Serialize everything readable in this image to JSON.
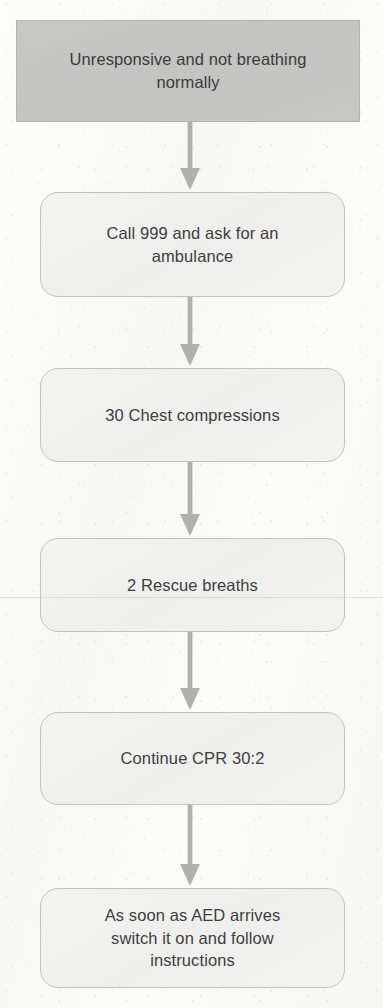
{
  "document": {
    "title": "Unresponsive and not breathing normally",
    "type": "flowchart",
    "subject": "Adult CPR / basic life support sequence"
  },
  "theme": {
    "page_background": "#fbfbfa",
    "header_fill": "#c6c6c4",
    "header_border": "#b4b4b2",
    "step_fill": "#f1f1ef",
    "step_border": "#c2c2c0",
    "arrow_color": "#b0b0ae",
    "text_color": "#3e3e3e"
  },
  "flowchart": {
    "type": "vertical-sequence",
    "nodes": [
      {
        "id": "node-1",
        "label": "Unresponsive and not breathing\nnormally",
        "shape": "rectangle",
        "style": "header"
      },
      {
        "id": "node-2",
        "label": "Call 999 and ask for an\nambulance",
        "shape": "rounded-rectangle",
        "style": "step"
      },
      {
        "id": "node-3",
        "label": "30 Chest compressions",
        "shape": "rounded-rectangle",
        "style": "step"
      },
      {
        "id": "node-4",
        "label": "2 Rescue breaths",
        "shape": "rounded-rectangle",
        "style": "step"
      },
      {
        "id": "node-5",
        "label": "Continue CPR 30:2",
        "shape": "rounded-rectangle",
        "style": "step"
      },
      {
        "id": "node-6",
        "label": "As soon as AED arrives\nswitch it on and follow\ninstructions",
        "shape": "rounded-rectangle",
        "style": "step"
      }
    ],
    "connectors": [
      {
        "id": "arrow-1",
        "from": "node-1",
        "to": "node-2",
        "direction": "down"
      },
      {
        "id": "arrow-2",
        "from": "node-2",
        "to": "node-3",
        "direction": "down"
      },
      {
        "id": "arrow-3",
        "from": "node-3",
        "to": "node-4",
        "direction": "down"
      },
      {
        "id": "arrow-4",
        "from": "node-4",
        "to": "node-5",
        "direction": "down"
      },
      {
        "id": "arrow-5",
        "from": "node-5",
        "to": "node-6",
        "direction": "down"
      }
    ]
  }
}
